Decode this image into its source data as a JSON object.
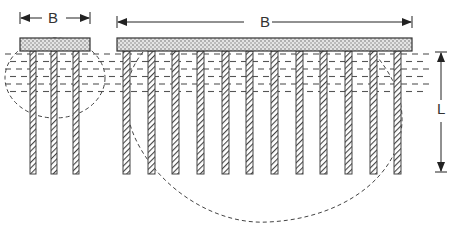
{
  "diagram": {
    "labels": {
      "small_group_width": "B",
      "large_group_width": "B",
      "pile_length": "L"
    },
    "small_group": {
      "cap": {
        "x": 20,
        "y": 38,
        "w": 70,
        "h": 13
      },
      "pile_x": [
        30,
        51,
        73
      ],
      "pile_width": 6,
      "pile_top": 51,
      "pile_bottom": 174,
      "stress_bulb": {
        "cx": 55,
        "cy": 78,
        "rx": 50,
        "ry": 40
      }
    },
    "large_group": {
      "cap": {
        "x": 117,
        "y": 38,
        "w": 295,
        "h": 13
      },
      "pile_x": [
        123,
        148,
        172,
        197,
        222,
        246,
        271,
        296,
        320,
        345,
        370,
        394
      ],
      "pile_width": 7,
      "pile_top": 51,
      "pile_bottom": 174,
      "stress_bulb": {
        "cx": 268,
        "cy": 115,
        "rx": 155,
        "ry": 107
      }
    },
    "soil_layer": {
      "y_top": 52,
      "y_bottom": 96,
      "x_left": 5,
      "x_right": 425
    },
    "dimension_arrows": {
      "small_B": {
        "y": 18,
        "x1": 20,
        "x2": 90
      },
      "large_B": {
        "y": 22,
        "x1": 117,
        "x2": 412
      },
      "L": {
        "x": 441,
        "y1": 52,
        "y2": 172
      }
    },
    "colors": {
      "line": "#333333",
      "cap_fill": "#d8d8d8",
      "dash": "#555555"
    }
  }
}
